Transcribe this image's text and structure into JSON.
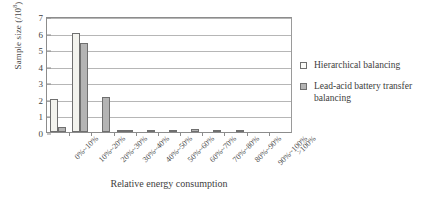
{
  "chart_data": {
    "type": "bar",
    "title": "",
    "xlabel": "Relative energy consumption",
    "ylabel": "Sample size (/10",
    "ylabel_exponent": "8",
    "ylabel_suffix": ")",
    "categories": [
      "0%~10%",
      "10%~20%",
      "20%~30%",
      "30%~40%",
      "40%~50%",
      "50%~60%",
      "60%~70%",
      "70%~80%",
      "80%~90%",
      "90%~100%",
      ">100%"
    ],
    "ylim": [
      0,
      7
    ],
    "yticks": [
      0,
      1,
      2,
      3,
      4,
      5,
      6,
      7
    ],
    "grid": "horizontal",
    "legend_position": "right",
    "series": [
      {
        "name": "Hierarchical balancing",
        "swatch": "open-square",
        "color": "#f3f3ee",
        "values": [
          2.0,
          6.0,
          0.0,
          0.05,
          0.0,
          0.0,
          0.0,
          0.0,
          0.0,
          0.0,
          0.0
        ]
      },
      {
        "name": "Lead-acid battery transfer balancing",
        "swatch": "filled-square",
        "color": "#b4b4b4",
        "values": [
          0.3,
          5.35,
          2.1,
          0.05,
          0.05,
          0.1,
          0.2,
          0.05,
          0.05,
          0.0,
          0.0
        ]
      }
    ]
  },
  "legend": {
    "items": [
      {
        "label": "Hierarchical balancing"
      },
      {
        "label": "Lead-acid battery transfer balancing"
      }
    ]
  }
}
